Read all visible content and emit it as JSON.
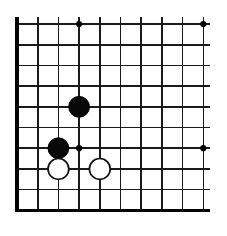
{
  "figure": {
    "kind": "go-board-diagram",
    "width_px": 227,
    "height_px": 236,
    "background_color": "#ffffff"
  },
  "board": {
    "description": "Lower-left corner of a Go board, partial grid",
    "visible_columns": 10,
    "visible_rows": 10,
    "line_spacing_px": 20.7,
    "origin_x_px": 17,
    "origin_y_px": 24,
    "line_color": "#1a1a1a",
    "edge_color": "#000000",
    "line_width_px": 1.6,
    "edge_width_px": 3.2,
    "edges": {
      "left": true,
      "bottom": true,
      "top": false,
      "right": false
    },
    "columns_x_px": [
      17,
      37.7,
      58.4,
      79.1,
      99.8,
      120.5,
      141.2,
      161.9,
      182.6,
      203.3
    ],
    "rows_y_px": [
      24,
      44.7,
      65.4,
      86.1,
      106.8,
      127.5,
      148.2,
      168.9,
      189.6,
      210.3
    ],
    "line_overshoot_px": 7
  },
  "star_points": {
    "label": "hoshi",
    "radius_px": 3.1,
    "color": "#000000",
    "points": [
      {
        "name": "star-point-top-left",
        "col": 3,
        "row": 0
      },
      {
        "name": "star-point-top-right",
        "col": 9,
        "row": 0
      },
      {
        "name": "star-point-center-left",
        "col": 3,
        "row": 6
      },
      {
        "name": "star-point-center-right",
        "col": 9,
        "row": 6
      }
    ]
  },
  "stones": {
    "radius_px": 10.4,
    "black_fill": "#080808",
    "white_fill": "#ffffff",
    "white_stroke": "#111111",
    "items": [
      {
        "name": "stone-black-1",
        "color": "black",
        "col": 3,
        "row": 4
      },
      {
        "name": "stone-black-2",
        "color": "black",
        "col": 2,
        "row": 6
      },
      {
        "name": "stone-white-1",
        "color": "white",
        "col": 2,
        "row": 7
      },
      {
        "name": "stone-white-2",
        "color": "white",
        "col": 4,
        "row": 7
      }
    ]
  }
}
